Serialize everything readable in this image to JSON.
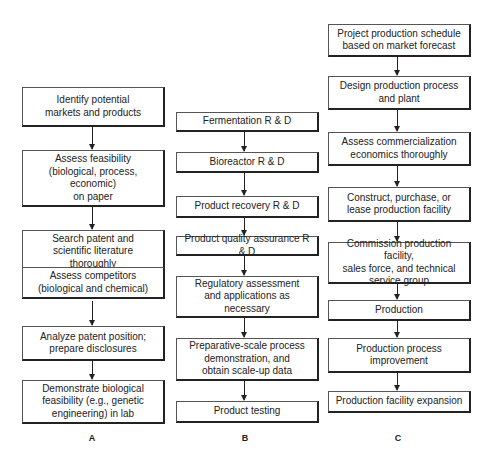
{
  "columns": [
    {
      "label": "A",
      "steps": [
        "Identify potential\nmarkets and products",
        "Assess feasibility\n(biological, process,\neconomic)\non paper",
        "Search patent and\nscientific literature\nthoroughly",
        "Assess competitors\n(biological and chemical)",
        "Analyze patent position;\nprepare disclosures",
        "Demonstrate biological\nfeasibility (e.g., genetic\nengineering) in lab"
      ]
    },
    {
      "label": "B",
      "steps": [
        "Fermentation R & D",
        "Bioreactor R & D",
        "Product recovery R & D",
        "Product quality assurance R & D",
        "Regulatory assessment\nand applications as\nnecessary",
        "Preparative-scale process\ndemonstration, and\nobtain scale-up data",
        "Product testing"
      ]
    },
    {
      "label": "C",
      "steps": [
        "Project production schedule\nbased on market forecast",
        "Design production process\nand plant",
        "Assess commercialization\neconomics thoroughly",
        "Construct, purchase, or\nlease production facility",
        "Commission production facility,\nsales force, and technical\nservice group",
        "Production",
        "Production process\nimprovement",
        "Production facility expansion"
      ]
    }
  ]
}
